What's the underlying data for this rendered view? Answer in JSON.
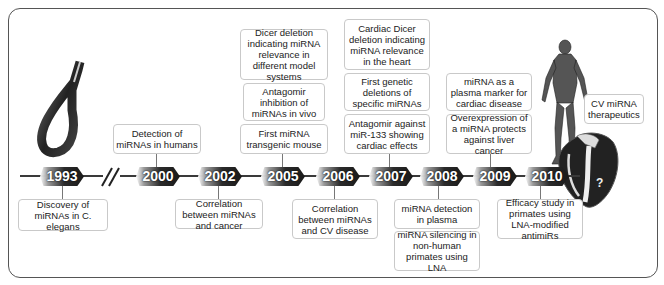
{
  "timeline": {
    "years": [
      "1993",
      "2000",
      "2002",
      "2005",
      "2006",
      "2007",
      "2008",
      "2009",
      "2010"
    ],
    "break_symbol": "//"
  },
  "events": {
    "y1993_below": "Discovery of miRNAs in C. elegans",
    "y2000_above": "Detection of miRNAs in humans",
    "y2002_below": "Correlation between miRNAs and cancer",
    "y2005_above_1": "Dicer deletion indicating miRNA relevance in different model systems",
    "y2005_above_2": "Antagomir inhibition of miRNAs in vivo",
    "y2005_above_3": "First miRNA transgenic mouse",
    "y2006_below": "Correlation between miRNAs and CV disease",
    "y2007_above_1": "Cardiac Dicer deletion indicating miRNA relevance in the heart",
    "y2007_above_2": "First genetic deletions of specific miRNAs",
    "y2007_above_3": "Antagomir against miR-133 showing cardiac effects",
    "y2008_below_1": "miRNA detection in plasma",
    "y2008_below_2": "miRNA silencing in non-human primates using LNA",
    "y2009_above_1": "miRNA as a plasma marker for cardiac disease",
    "y2009_above_2": "Overexpression of a miRNA protects against liver cancer",
    "y2010_below": "Efficacy study in primates using LNA-modified antimiRs",
    "future": "CV miRNA therapeutics"
  },
  "illustrations": {
    "worm": "c-elegans-worm",
    "human": "human-anatomy-figure",
    "heart": "heart-with-question-mark",
    "heart_label": "?"
  },
  "colors": {
    "badge_dark": "#1a1a1a",
    "line": "#3a3a3a",
    "box_border": "#c9c9c9"
  }
}
